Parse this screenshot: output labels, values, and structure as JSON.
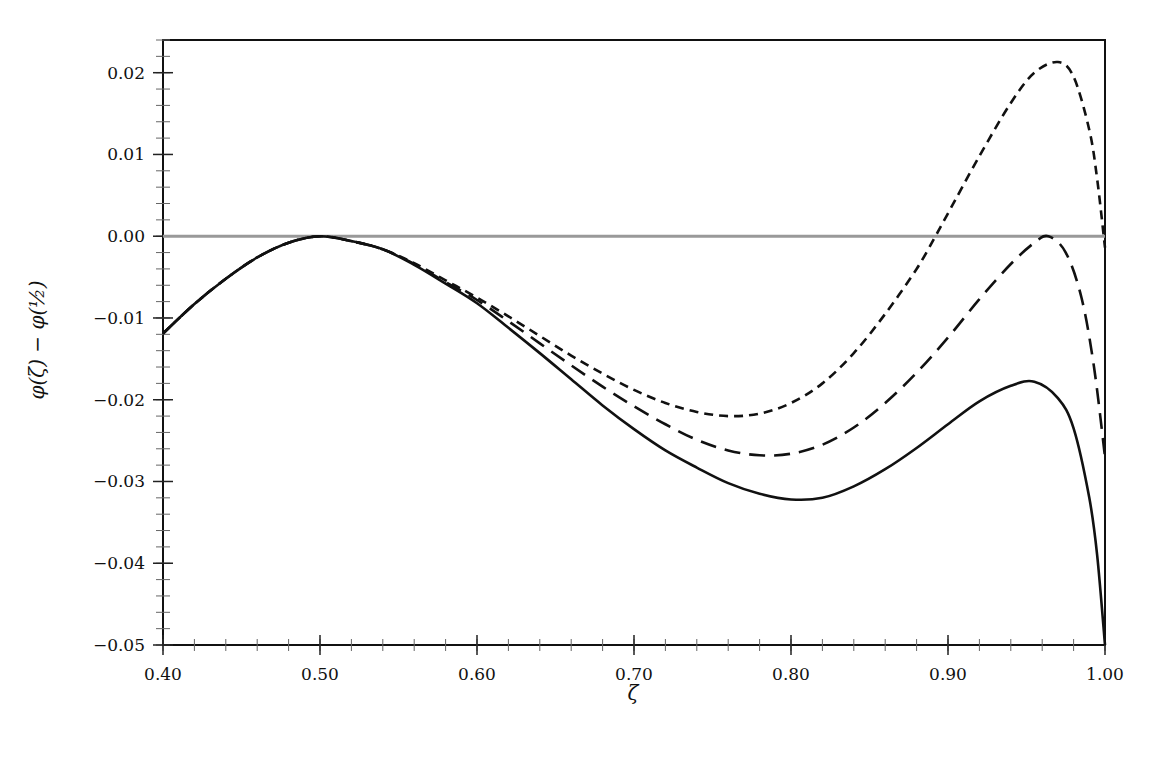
{
  "chart_data": {
    "type": "line",
    "title": "",
    "xlabel": "ζ",
    "ylabel": "φ(ζ) − φ(½)",
    "xlim": [
      0.4,
      1.0
    ],
    "ylim": [
      -0.05,
      0.024
    ],
    "grid": false,
    "legend": null,
    "x_ticks": [
      0.4,
      0.5,
      0.6,
      0.7,
      0.8,
      0.9,
      1.0
    ],
    "x_tick_labels": [
      "0.40",
      "0.50",
      "0.60",
      "0.70",
      "0.80",
      "0.90",
      "1.00"
    ],
    "x_minor_step": 0.02,
    "y_ticks": [
      0.02,
      0.01,
      0.0,
      -0.01,
      -0.02,
      -0.03,
      -0.04,
      -0.05
    ],
    "y_tick_labels": [
      "0.02",
      "0.01",
      "0.00",
      "−0.01",
      "−0.02",
      "−0.03",
      "−0.04",
      "−0.05"
    ],
    "y_minor_step": 0.002,
    "reference_line": {
      "y": 0.0,
      "color": "#999999"
    },
    "series": [
      {
        "name": "solid",
        "style": "solid",
        "color": "#111111",
        "x": [
          0.4,
          0.42,
          0.44,
          0.46,
          0.48,
          0.5,
          0.52,
          0.54,
          0.56,
          0.58,
          0.6,
          0.62,
          0.64,
          0.66,
          0.68,
          0.7,
          0.72,
          0.74,
          0.76,
          0.78,
          0.8,
          0.82,
          0.84,
          0.86,
          0.88,
          0.9,
          0.92,
          0.94,
          0.955,
          0.97,
          0.98,
          0.99,
          0.995,
          1.0
        ],
        "y": [
          -0.0119,
          -0.0083,
          -0.0052,
          -0.0026,
          -0.0008,
          0.0,
          -0.0006,
          -0.0016,
          -0.0035,
          -0.0058,
          -0.0082,
          -0.0112,
          -0.0143,
          -0.0175,
          -0.0207,
          -0.0236,
          -0.0262,
          -0.0283,
          -0.0302,
          -0.0315,
          -0.0322,
          -0.032,
          -0.0306,
          -0.0285,
          -0.0259,
          -0.023,
          -0.0202,
          -0.0183,
          -0.0178,
          -0.0198,
          -0.0235,
          -0.032,
          -0.039,
          -0.05
        ]
      },
      {
        "name": "long-dash",
        "style": "long-dash",
        "color": "#111111",
        "x": [
          0.4,
          0.42,
          0.44,
          0.46,
          0.48,
          0.5,
          0.52,
          0.54,
          0.56,
          0.58,
          0.6,
          0.62,
          0.64,
          0.66,
          0.68,
          0.7,
          0.72,
          0.74,
          0.76,
          0.78,
          0.8,
          0.82,
          0.84,
          0.86,
          0.88,
          0.9,
          0.92,
          0.94,
          0.955,
          0.964,
          0.975,
          0.985,
          0.993,
          1.0
        ],
        "y": [
          -0.0119,
          -0.0083,
          -0.0052,
          -0.0026,
          -0.0008,
          0.0,
          -0.0006,
          -0.0016,
          -0.0034,
          -0.0056,
          -0.0078,
          -0.0104,
          -0.0131,
          -0.0158,
          -0.0184,
          -0.0208,
          -0.023,
          -0.0249,
          -0.0262,
          -0.0268,
          -0.0266,
          -0.0255,
          -0.0234,
          -0.0204,
          -0.0167,
          -0.0124,
          -0.0077,
          -0.0034,
          -0.0008,
          0.0,
          -0.002,
          -0.0075,
          -0.016,
          -0.027
        ]
      },
      {
        "name": "short-dash",
        "style": "short-dash",
        "color": "#111111",
        "x": [
          0.4,
          0.42,
          0.44,
          0.46,
          0.48,
          0.5,
          0.52,
          0.54,
          0.56,
          0.58,
          0.6,
          0.62,
          0.64,
          0.66,
          0.68,
          0.7,
          0.72,
          0.74,
          0.76,
          0.78,
          0.8,
          0.82,
          0.84,
          0.86,
          0.88,
          0.892,
          0.9,
          0.92,
          0.94,
          0.955,
          0.97,
          0.98,
          0.99,
          0.995,
          1.0
        ],
        "y": [
          -0.0119,
          -0.0083,
          -0.0052,
          -0.0026,
          -0.0008,
          0.0,
          -0.0006,
          -0.0016,
          -0.0033,
          -0.0054,
          -0.0075,
          -0.0098,
          -0.0122,
          -0.0146,
          -0.0168,
          -0.0188,
          -0.0204,
          -0.0215,
          -0.022,
          -0.0217,
          -0.0204,
          -0.018,
          -0.0143,
          -0.0095,
          -0.004,
          0.0,
          0.0028,
          0.0098,
          0.0163,
          0.02,
          0.0213,
          0.0195,
          0.013,
          0.007,
          -0.0014
        ]
      }
    ]
  }
}
